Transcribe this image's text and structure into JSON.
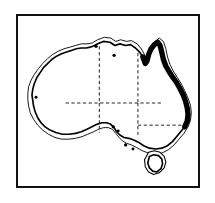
{
  "figure": {
    "kind": "map-line-art",
    "title": "Australia",
    "frame": {
      "style": "solid-black-rectangle",
      "color": "#111111",
      "background": "#ffffff"
    },
    "colors": {
      "outline": "#000000",
      "halo": "#000000",
      "highlight": "#000000",
      "border_dashed": "#222222",
      "land_fill": "#ffffff",
      "page": "#ffffff"
    }
  },
  "map": {
    "region_label": "Australia",
    "projection_note": "schematic outline",
    "layers": [
      {
        "name": "offshore-halo-outline",
        "label": "Offshore halo outline",
        "stroke_width": 1.1
      },
      {
        "name": "mainland-coastline",
        "label": "Mainland coastline",
        "stroke_width": 2.0
      },
      {
        "name": "highlighted-east-coast",
        "label": "Highlighted eastern coastline",
        "stroke_width": 6.5,
        "extent": "Gulf of Carpentaria around Cape York south to central New South Wales"
      },
      {
        "name": "state-borders",
        "label": "State and territory borders",
        "stroke_width": 1.0,
        "dash": "4 3"
      },
      {
        "name": "tasmania",
        "label": "Tasmania",
        "stroke_width": 2.0
      },
      {
        "name": "city-markers",
        "label": "City markers",
        "count": 7
      }
    ],
    "city_markers": [
      {
        "name": "marker-north-1",
        "x": 95,
        "y": 26,
        "r": 2.0
      },
      {
        "name": "marker-north-2",
        "x": 117,
        "y": 37,
        "r": 2.0
      },
      {
        "name": "marker-west-1",
        "x": 22,
        "y": 88,
        "r": 1.8
      },
      {
        "name": "marker-south-1",
        "x": 116,
        "y": 124,
        "r": 2.0
      },
      {
        "name": "marker-south-2",
        "x": 122,
        "y": 129,
        "r": 1.8
      },
      {
        "name": "marker-south-3",
        "x": 131,
        "y": 146,
        "r": 2.0
      },
      {
        "name": "marker-tas-1",
        "x": 140,
        "y": 151,
        "r": 1.8
      }
    ]
  },
  "paths": {
    "mainland_coast": "M 97 23 L 104 20 L 112 21 L 118 25 L 124 23 L 131 25 L 137 24 L 143 28 L 148 33 L 152 39 L 155 47 L 157 44 L 159 36 L 162 29 L 166 24 L 170 21 L 173 25 L 175 33 L 177 42 L 180 50 L 184 57 L 188 63 L 193 70 L 197 77 L 201 85 L 204 93 L 206 101 L 207 109 L 206 117 L 203 124 L 198 130 L 193 136 L 188 142 L 182 147 L 175 150 L 168 151 L 160 150 L 153 147 L 147 143 L 141 140 L 135 138 L 129 137 L 124 134 L 120 130 L 117 125 L 113 121 L 108 119 L 102 119 L 96 121 L 90 124 L 84 127 L 77 130 L 70 132 L 62 133 L 54 133 L 46 131 L 39 128 L 33 124 L 28 119 L 24 113 L 21 106 L 19 99 L 18 92 L 17 85 L 18 78 L 20 71 L 23 64 L 27 58 L 31 52 L 36 47 L 41 42 L 47 38 L 53 35 L 59 33 L 65 31 L 71 29 L 77 28 L 83 28 L 88 27 L 93 25 Z",
    "halo_coast": "M 97 18 L 105 15 L 113 16 L 119 20 L 125 18 L 132 20 L 138 19 L 145 23 L 150 29 L 154 36 L 157 44 L 160 35 L 163 27 L 167 20 L 172 16 L 177 20 L 180 29 L 182 39 L 185 48 L 189 56 L 194 64 L 199 72 L 203 80 L 207 89 L 210 98 L 211 107 L 210 116 L 207 124 L 202 132 L 196 139 L 190 146 L 183 152 L 175 156 L 167 157 L 159 156 L 151 153 L 144 149 L 138 146 L 132 144 L 127 141 L 123 137 L 119 132 L 115 127 L 110 125 L 104 125 L 98 127 L 92 130 L 85 133 L 78 136 L 70 138 L 62 139 L 53 139 L 45 137 L 37 133 L 30 128 L 24 122 L 19 115 L 15 107 L 13 99 L 12 91 L 12 83 L 13 75 L 16 67 L 20 60 L 25 53 L 30 47 L 36 41 L 42 36 L 49 32 L 56 29 L 63 27 L 70 25 L 77 23 L 84 23 L 90 22 Z",
    "highlight_east": "M 152 39 L 155 47 L 157 44 L 159 36 L 162 29 L 166 24 L 170 21 L 173 25 L 175 33 L 177 42 L 180 50 L 184 57 L 188 63 L 193 70 L 197 77 L 201 85 L 204 93 L 206 101 L 207 109 L 206 117 L 203 124",
    "tasmania": "M 160 160 L 165 158 L 171 159 L 175 163 L 176 169 L 174 175 L 169 179 L 164 178 L 160 174 L 158 168 Z",
    "tasmania_halo": "M 159 155 L 166 153 L 173 155 L 178 160 L 180 167 L 178 174 L 172 180 L 165 182 L 159 179 L 155 173 L 154 164 Z",
    "border_wa_nt_sa": "M 99 26 L 99 95",
    "border_nt_qld": "M 146 34 L 146 95",
    "border_sa_nsw_vic": "M 58 95 L 175 95",
    "border_sa_east": "M 146 95 L 146 136",
    "border_nsw_vic": "M 146 122 L 205 122",
    "border_wa_sa_lower": "M 99 95 L 99 131"
  }
}
